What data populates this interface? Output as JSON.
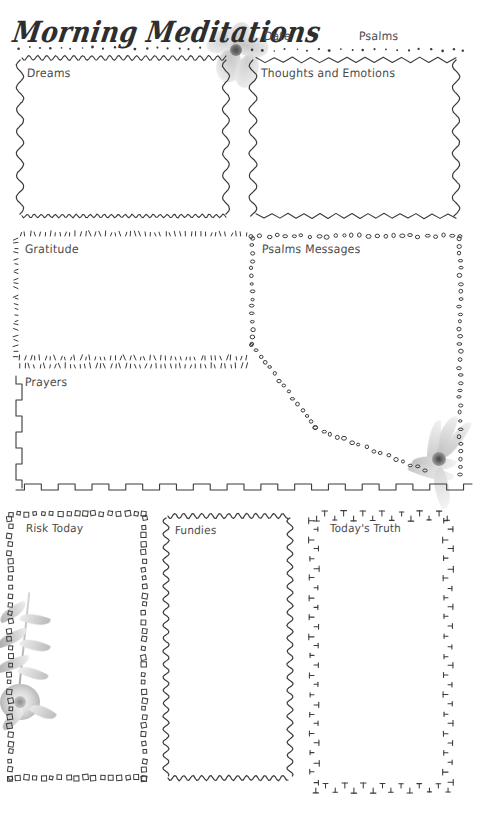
{
  "page": {
    "title": "Morning Meditations",
    "width": 488,
    "height": 821,
    "background_color": "#ffffff",
    "ink_color": "#3b3b3b"
  },
  "header": {
    "title": "Morning Meditations",
    "date_label": "Date",
    "date_value": "",
    "psalms_label": "Psalms",
    "psalms_value": "",
    "flower_icon": "watercolor-flower-icon"
  },
  "sections": [
    {
      "id": "dreams",
      "label": "Dreams",
      "value": "",
      "border_style": "wavy",
      "x": 18,
      "y": 58,
      "w": 208,
      "h": 158
    },
    {
      "id": "thoughts-and-emotions",
      "label": "Thoughts and Emotions",
      "value": "",
      "border_style": "zigzag",
      "x": 250,
      "y": 58,
      "w": 206,
      "h": 158
    },
    {
      "id": "gratitude",
      "label": "Gratitude",
      "value": "",
      "border_style": "tick-dashes",
      "x": 14,
      "y": 232,
      "w": 232,
      "h": 128
    },
    {
      "id": "psalms-messages",
      "label": "Psalms Messages",
      "value": "",
      "border_style": "dotted-circles",
      "x": 248,
      "y": 232,
      "w": 212,
      "h": 248
    },
    {
      "id": "prayers",
      "label": "Prayers",
      "value": "",
      "border_style": "square-wave",
      "x": 12,
      "y": 366,
      "w": 234,
      "h": 124
    },
    {
      "id": "risk-today",
      "label": "Risk Today",
      "value": "",
      "border_style": "small-squares",
      "x": 8,
      "y": 512,
      "w": 136,
      "h": 266
    },
    {
      "id": "fundies",
      "label": "Fundies",
      "value": "",
      "border_style": "wavy",
      "x": 164,
      "y": 514,
      "w": 126,
      "h": 264
    },
    {
      "id": "todays-truth",
      "label": "Today's Truth",
      "value": "",
      "border_style": "tee-marks",
      "x": 312,
      "y": 512,
      "w": 136,
      "h": 276
    }
  ],
  "decorations": [
    {
      "id": "top-center-flower",
      "icon": "watercolor-flower-icon",
      "x": 200,
      "y": 20,
      "w": 70,
      "h": 70
    },
    {
      "id": "mid-right-flower",
      "icon": "watercolor-flower-icon",
      "x": 404,
      "y": 415,
      "w": 76,
      "h": 90
    },
    {
      "id": "bottom-left-botanical",
      "icon": "watercolor-botanical-icon",
      "x": 0,
      "y": 590,
      "w": 80,
      "h": 160
    }
  ],
  "colors": {
    "ink": "#3b3b3b",
    "label_ink": "#4a4a4a",
    "flower_gray": "#b9b9b9",
    "flower_gray_light": "#dedede",
    "leaf_gray": "#a9a9a9"
  }
}
